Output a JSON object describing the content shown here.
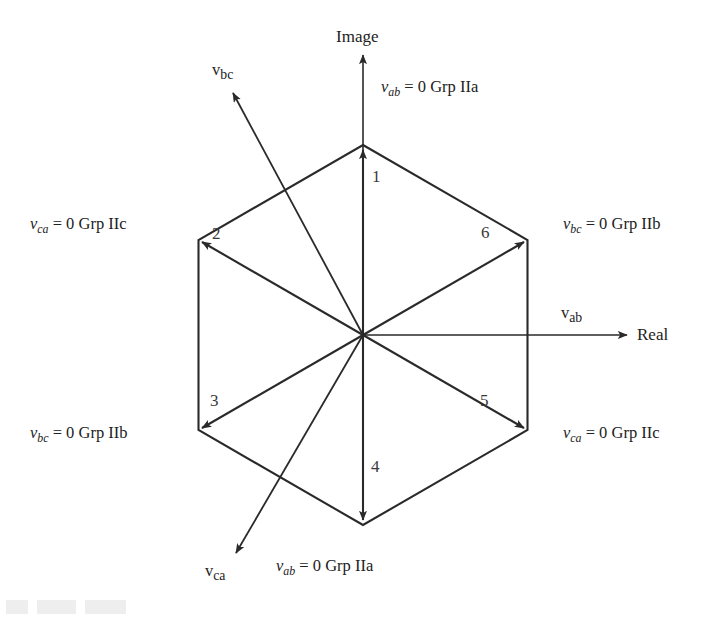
{
  "figure": {
    "type": "vector-space-hexagon-diagram",
    "axes": {
      "vertical": {
        "name": "Image",
        "direction": "up"
      },
      "horizontal": {
        "name": "Real",
        "direction": "right"
      }
    },
    "vectors": [
      {
        "id": "v-ab",
        "symbol": "v",
        "subscript": "ab",
        "angle_deg": 0
      },
      {
        "id": "v-bc",
        "symbol": "v",
        "subscript": "bc",
        "angle_deg": 115
      },
      {
        "id": "v-ca",
        "symbol": "v",
        "subscript": "ca",
        "angle_deg": 249
      }
    ],
    "sectors": [
      {
        "number": "1",
        "x": 372,
        "y": 175
      },
      {
        "number": "2",
        "x": 212,
        "y": 232
      },
      {
        "number": "3",
        "x": 210,
        "y": 399
      },
      {
        "number": "4",
        "x": 371,
        "y": 465
      },
      {
        "number": "5",
        "x": 480,
        "y": 399
      },
      {
        "number": "6",
        "x": 481,
        "y": 231
      }
    ],
    "vertex_labels": [
      {
        "id": "top",
        "symbol": "v",
        "subscript": "ab",
        "rest": " = 0 Grp IIa"
      },
      {
        "id": "upper-right",
        "symbol": "v",
        "subscript": "bc",
        "rest": " = 0 Grp IIb"
      },
      {
        "id": "lower-right",
        "symbol": "v",
        "subscript": "ca",
        "rest": " = 0 Grp IIc"
      },
      {
        "id": "bottom",
        "symbol": "v",
        "subscript": "ab",
        "rest": " = 0 Grp IIa"
      },
      {
        "id": "lower-left",
        "symbol": "v",
        "subscript": "bc",
        "rest": " = 0 Grp IIb"
      },
      {
        "id": "upper-left",
        "symbol": "v",
        "subscript": "ca",
        "rest": " = 0 Grp IIc"
      }
    ],
    "colors": {
      "line": "#2a2a2a",
      "text": "#222222",
      "background": "#ffffff"
    },
    "geometry": {
      "center_x": 363,
      "center_y": 335,
      "radius": 190
    }
  },
  "labels": {
    "top": {
      "sym": "v",
      "sub": "ab",
      "rest": " = 0 Grp IIa"
    },
    "upper_right": {
      "sym": "v",
      "sub": "bc",
      "rest": " = 0 Grp IIb"
    },
    "lower_right": {
      "sym": "v",
      "sub": "ca",
      "rest": " = 0 Grp IIc"
    },
    "bottom": {
      "sym": "v",
      "sub": "ab",
      "rest": " = 0 Grp IIa"
    },
    "lower_left": {
      "sym": "v",
      "sub": "bc",
      "rest": " = 0 Grp IIb"
    },
    "upper_left": {
      "sym": "v",
      "sub": "ca",
      "rest": " = 0 Grp IIc"
    }
  },
  "axis_labels": {
    "image": "Image",
    "real": "Real"
  },
  "vector_labels": {
    "v_ab": {
      "sym": "v",
      "sub": "ab"
    },
    "v_bc": {
      "sym": "v",
      "sub": "bc"
    },
    "v_ca": {
      "sym": "v",
      "sub": "ca"
    }
  },
  "sector_numbers": {
    "s1": "1",
    "s2": "2",
    "s3": "3",
    "s4": "4",
    "s5": "5",
    "s6": "6"
  }
}
